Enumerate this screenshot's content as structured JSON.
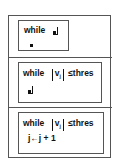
{
  "diagram": {
    "type": "nested-structure-editor",
    "sections": [
      {
        "keyword": "while",
        "condition": {
          "placeholder": true
        },
        "body": {
          "placeholder_dot": true
        }
      },
      {
        "keyword": "while",
        "condition": {
          "abs_var": "v",
          "abs_sub": "j",
          "operator": "≤",
          "rhs": "thres"
        },
        "body": {
          "placeholder": true
        }
      },
      {
        "keyword": "while",
        "condition": {
          "abs_var": "v",
          "abs_sub": "j",
          "operator": "≤",
          "rhs": "thres"
        },
        "body": {
          "statement": "j←j + 1"
        }
      }
    ]
  }
}
